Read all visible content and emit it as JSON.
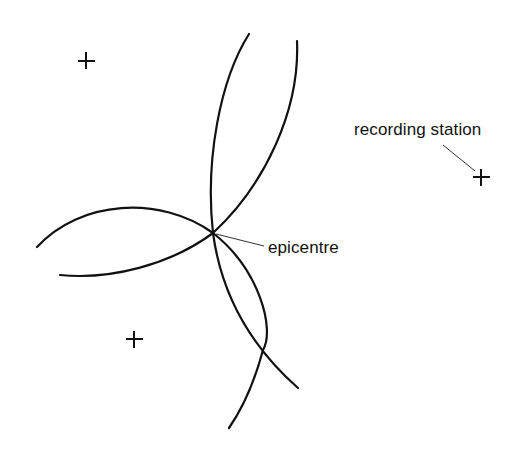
{
  "diagram": {
    "type": "epicentre-triangulation",
    "colors": {
      "line": "#111111",
      "background": "#ffffff"
    },
    "stations": [
      {
        "id": "station-top-left",
        "x": 86,
        "y": 61
      },
      {
        "id": "station-right",
        "x": 481,
        "y": 177
      },
      {
        "id": "station-bottom-left",
        "x": 134,
        "y": 339
      }
    ],
    "epicentre_point": {
      "x": 213,
      "y": 233
    },
    "labels": {
      "recording_station": "recording station",
      "epicentre": "epicentre"
    }
  }
}
